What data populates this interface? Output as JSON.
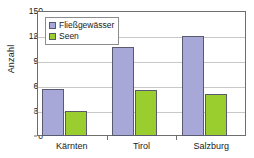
{
  "chart_data": {
    "type": "bar",
    "title": "",
    "xlabel": "",
    "ylabel": "Anzahl",
    "categories": [
      "Kärnten",
      "Tirol",
      "Salzburg"
    ],
    "series": [
      {
        "name": "Fließgewässer",
        "values": [
          57,
          107,
          120
        ],
        "color": "#a8a8d8"
      },
      {
        "name": "Seen",
        "values": [
          30,
          55,
          51
        ],
        "color": "#9ace2e"
      }
    ],
    "ylim": [
      0,
      150
    ],
    "yticks": [
      0,
      30,
      60,
      90,
      120,
      150
    ],
    "ytick_labels": [
      "0",
      "30",
      "60",
      "90",
      "120",
      "150"
    ],
    "grid": "horizontal",
    "legend_position": "top-left-inside",
    "frame_color": "#6e6e6e",
    "grid_color": "#c8c8c8",
    "bar_border_color": "#5a5a6e",
    "background": "#ffffff"
  }
}
